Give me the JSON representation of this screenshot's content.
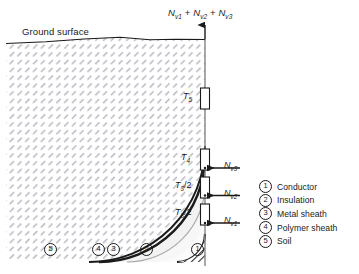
{
  "figure": {
    "ground_label": "Ground surface",
    "top_equation": {
      "n1": "N",
      "n1sub": "v1",
      "plus1": " + ",
      "n2": "N",
      "n2sub": "v2",
      "plus2": " + ",
      "n3": "N",
      "n3sub": "v3"
    },
    "thermal_resistances": [
      {
        "name": "T5",
        "sym": "T",
        "sub": "5",
        "den": ""
      },
      {
        "name": "T4",
        "sym": "T",
        "sub": "4",
        "den": ""
      },
      {
        "name": "T3a",
        "sym": "T",
        "sub": "3",
        "den": "/2"
      },
      {
        "name": "T3b",
        "sym": "T",
        "sub": "3",
        "den": "/2"
      }
    ],
    "heat_sources": [
      {
        "name": "Nv3",
        "sym": "N",
        "sub": "v3"
      },
      {
        "name": "Nv2",
        "sym": "N",
        "sub": "v2"
      },
      {
        "name": "Nv1",
        "sym": "N",
        "sub": "v1"
      }
    ],
    "callouts": [
      "1",
      "2",
      "3",
      "4",
      "5"
    ]
  },
  "legend": {
    "items": [
      {
        "num": "1",
        "label": "Conductor"
      },
      {
        "num": "2",
        "label": "Insulation"
      },
      {
        "num": "3",
        "label": "Metal sheath"
      },
      {
        "num": "4",
        "label": "Polymer sheath"
      },
      {
        "num": "5",
        "label": "Soil"
      }
    ]
  },
  "colors": {
    "line": "#1a1a1a",
    "soil_hatch": "#b4b4bc",
    "insulation_fill": "#f2f2f2",
    "sheath_line": "#9a9a9a",
    "background": "#ffffff"
  }
}
